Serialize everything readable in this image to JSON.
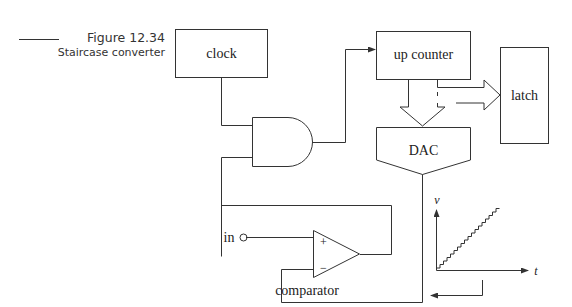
{
  "caption": {
    "figure_label": "Figure 12.34",
    "title": "Staircase converter"
  },
  "blocks": {
    "clock": "clock",
    "up_counter": "up counter",
    "latch": "latch",
    "dac": "DAC",
    "comparator": "comparator"
  },
  "comparator_pins": {
    "plus": "+",
    "minus": "−"
  },
  "input_label": "in",
  "graph": {
    "y_axis_label": "v",
    "x_axis_label": "t"
  },
  "colors": {
    "line": "#333333",
    "background": "#ffffff"
  }
}
